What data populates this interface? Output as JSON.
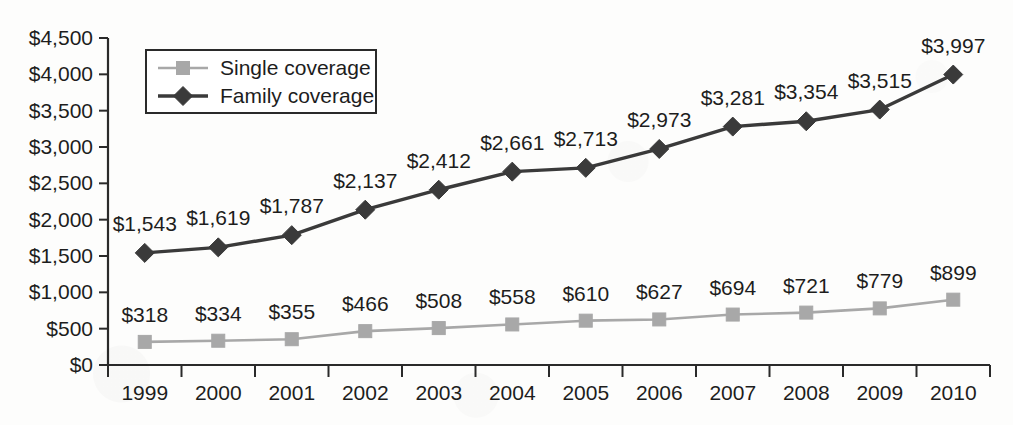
{
  "chart_data": {
    "type": "line",
    "title": "",
    "subtitle": "",
    "xlabel": "",
    "ylabel": "",
    "categories": [
      "1999",
      "2000",
      "2001",
      "2002",
      "2003",
      "2004",
      "2005",
      "2006",
      "2007",
      "2008",
      "2009",
      "2010"
    ],
    "series": [
      {
        "name": "Single coverage",
        "color": "#a8a8a8",
        "marker": "square",
        "values": [
          318,
          334,
          355,
          466,
          508,
          558,
          610,
          627,
          694,
          721,
          779,
          899
        ],
        "labels": [
          "$318",
          "$334",
          "$355",
          "$466",
          "$508",
          "$558",
          "$610",
          "$627",
          "$694",
          "$721",
          "$779",
          "$899"
        ]
      },
      {
        "name": "Family coverage",
        "color": "#3a3a3a",
        "marker": "diamond",
        "values": [
          1543,
          1619,
          1787,
          2137,
          2412,
          2661,
          2713,
          2973,
          3281,
          3354,
          3515,
          3997
        ],
        "labels": [
          "$1,543",
          "$1,619",
          "$1,787",
          "$2,137",
          "$2,412",
          "$2,661",
          "$2,713",
          "$2,973",
          "$3,281",
          "$3,354",
          "$3,515",
          "$3,997"
        ]
      }
    ],
    "ylim": [
      0,
      4500
    ],
    "ytick_values": [
      0,
      500,
      1000,
      1500,
      2000,
      2500,
      3000,
      3500,
      4000,
      4500
    ],
    "ytick_labels": [
      "$0",
      "$500",
      "$1,000",
      "$1,500",
      "$2,000",
      "$2,500",
      "$3,000",
      "$3,500",
      "$4,000",
      "$4,500"
    ],
    "grid": false,
    "legend_position": "top-left",
    "legend_entries": [
      "Single coverage",
      "Family coverage"
    ]
  },
  "axis": {
    "y_axis_name": "y-axis",
    "x_axis_name": "x-axis"
  },
  "colors": {
    "single": "#a8a8a8",
    "family": "#3a3a3a",
    "axis": "#2a2a2a",
    "text": "#1d1d1d",
    "background": "#fdfdfc"
  }
}
